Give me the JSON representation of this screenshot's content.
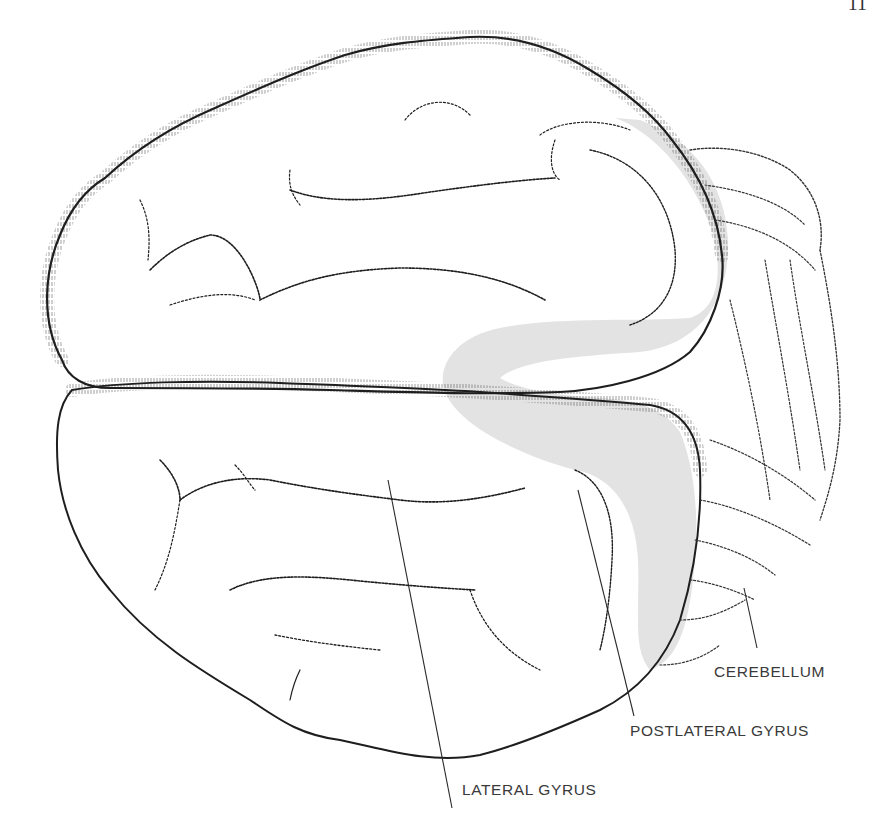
{
  "figure": {
    "highlight_color": "#e2e2e2",
    "ink_color": "#1e1e1e",
    "page_mark": "11"
  },
  "labels": {
    "cerebellum": "CEREBELLUM",
    "postlateral_gyrus": "POSTLATERAL GYRUS",
    "lateral_gyrus": "LATERAL GYRUS"
  }
}
